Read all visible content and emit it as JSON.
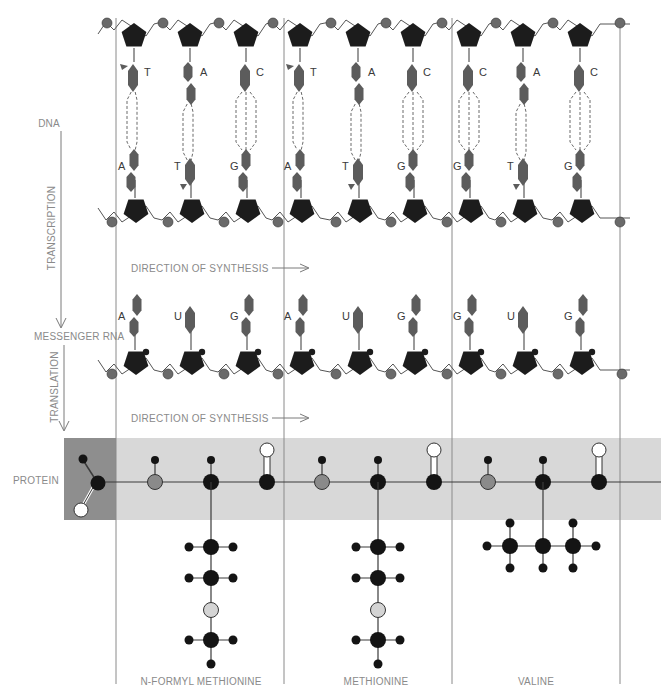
{
  "figure": {
    "title": "",
    "side_labels": {
      "dna": "DNA",
      "transcription": "TRANSCRIPTION",
      "messenger_rna": "MESSENGER RNA",
      "translation": "TRANSLATION",
      "protein": "PROTEIN"
    },
    "direction_label": "DIRECTION OF SYNTHESIS",
    "colors": {
      "sugar": "#1c1c1c",
      "base": "#5c5c5c",
      "phosphate": "#6a6a6a",
      "line": "#7a7a7a",
      "protein_band": "#d8d8d8",
      "protein_formyl_box": "#8e8e8e",
      "atom_dark": "#141414",
      "atom_gray": "#8a8a8a",
      "atom_light": "#d4d4d4",
      "atom_white": "#ffffff",
      "text": "#8a8a8a"
    },
    "codons": [
      {
        "amino_acid": "N-FORMYL METHIONINE",
        "dna_top": [
          "T",
          "A",
          "C"
        ],
        "dna_bottom": [
          "A",
          "T",
          "G"
        ],
        "mrna": [
          "A",
          "U",
          "G"
        ]
      },
      {
        "amino_acid": "METHIONINE",
        "dna_top": [
          "T",
          "A",
          "C"
        ],
        "dna_bottom": [
          "A",
          "T",
          "G"
        ],
        "mrna": [
          "A",
          "U",
          "G"
        ]
      },
      {
        "amino_acid": "VALINE",
        "dna_top": [
          "C",
          "A",
          "C"
        ],
        "dna_bottom": [
          "G",
          "T",
          "G"
        ],
        "mrna": [
          "G",
          "U",
          "G"
        ]
      }
    ],
    "side_chains": [
      {
        "name": "n-formyl-methionine",
        "atoms": [
          "CH2",
          "CH2",
          "S",
          "CH3"
        ]
      },
      {
        "name": "methionine",
        "atoms": [
          "CH2",
          "CH2",
          "S",
          "CH3"
        ]
      },
      {
        "name": "valine",
        "atoms": [
          "CH",
          "CH3",
          "CH3"
        ]
      }
    ]
  }
}
